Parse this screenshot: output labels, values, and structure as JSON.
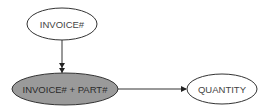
{
  "diagram": {
    "type": "dependency-diagram",
    "nodes": [
      {
        "id": "invoice",
        "label": "INVOICE#",
        "shaded": false
      },
      {
        "id": "composite_key",
        "label": "INVOICE# + PART#",
        "shaded": true
      },
      {
        "id": "quantity",
        "label": "QUANTITY",
        "shaded": false
      }
    ],
    "edges": [
      {
        "from": "invoice",
        "to": "composite_key",
        "arrow": "double"
      },
      {
        "from": "composite_key",
        "to": "quantity",
        "arrow": "single"
      }
    ],
    "colors": {
      "shaded_fill": "#9a9a9a",
      "plain_fill": "#ffffff",
      "stroke": "#333333",
      "text": "#444444"
    }
  }
}
